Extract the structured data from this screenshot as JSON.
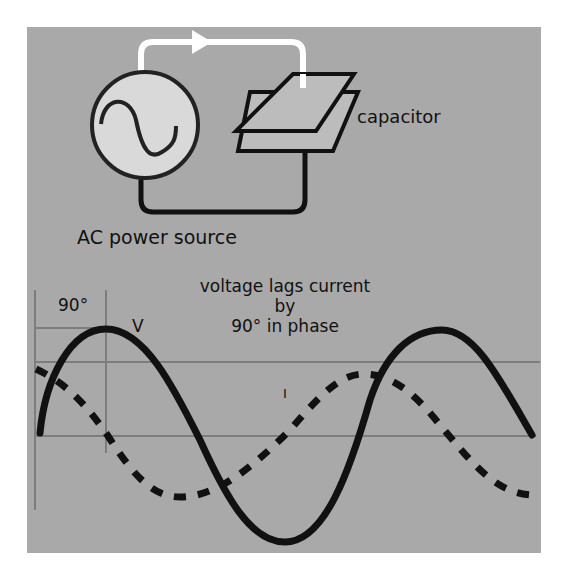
{
  "diagram": {
    "circuit": {
      "source_label": "AC power source",
      "component_label": "capacitor",
      "source_icon": "ac-sine-icon",
      "current_direction": "right"
    },
    "waveform": {
      "title_lines": [
        "voltage lags current",
        "by",
        "90° in phase"
      ],
      "phase_marker_label": "90°",
      "voltage_label": "V",
      "current_label": "I"
    }
  },
  "colors": {
    "panel": "#a9a9a9",
    "source_fill": "#d9d9d9",
    "stroke": "#111111",
    "wire_positive": "#ffffff",
    "gridline": "#7d7d7d"
  }
}
